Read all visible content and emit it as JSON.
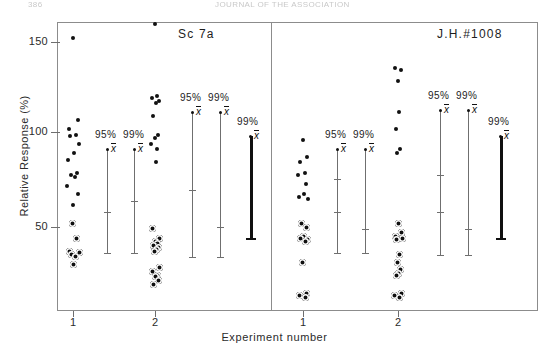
{
  "page": {
    "folio": "386",
    "running_head": "JOURNAL OF THE ASSOCIATION"
  },
  "chart_data": {
    "type": "scatter",
    "title": "",
    "xlabel": "Experiment number",
    "ylabel": "Relative Response  (%)",
    "ylim": [
      12,
      170
    ],
    "yticks": [
      50,
      100,
      150
    ],
    "ytick_labels": [
      "50",
      "100",
      "150"
    ],
    "grid": false,
    "legend": "none",
    "panels": [
      {
        "name": "left-panel",
        "label": "Sc  7a",
        "groups": [
          {
            "name": "experiment-1",
            "xtick_label": "1",
            "values": [
              152,
              108,
              103,
              100,
              99,
              95,
              90,
              86,
              79,
              78,
              77,
              72,
              68,
              62,
              52,
              44,
              37,
              36,
              35,
              34,
              30
            ],
            "intervals": [
              {
                "level": "95%",
                "mean": 92,
                "low": 36,
                "high": 92
              },
              {
                "level": "99%",
                "mean": 92,
                "low": 36,
                "high": 92
              }
            ]
          },
          {
            "name": "experiment-2",
            "xtick_label": "2",
            "values": [
              160,
              121,
              120,
              118,
              117,
              110,
              100,
              98,
              95,
              92,
              85,
              49,
              44,
              42,
              41,
              40,
              39,
              38,
              37,
              28,
              26,
              24,
              23,
              21,
              19
            ],
            "intervals": [
              {
                "level": "95%",
                "mean": 112,
                "low": 34,
                "high": 112
              },
              {
                "level": "99%",
                "mean": 112,
                "low": 34,
                "high": 112
              },
              {
                "level": "99%",
                "mean": 99,
                "low": 44,
                "high": 99
              }
            ]
          }
        ]
      },
      {
        "name": "right-panel",
        "label": "J.H.#1008",
        "groups": [
          {
            "name": "experiment-1",
            "xtick_label": "1",
            "values": [
              97,
              88,
              85,
              79,
              78,
              73,
              68,
              66,
              65,
              52,
              50,
              45,
              44,
              43,
              42,
              31,
              14,
              13,
              12
            ],
            "intervals": [
              {
                "level": "95%",
                "mean": 92,
                "low": 36,
                "high": 92
              },
              {
                "level": "99%",
                "mean": 92,
                "low": 36,
                "high": 92
              }
            ]
          },
          {
            "name": "experiment-2",
            "xtick_label": "2",
            "values": [
              136,
              135,
              129,
              112,
              103,
              92,
              90,
              52,
              47,
              45,
              44,
              43,
              35,
              31,
              27,
              25,
              24,
              14,
              13,
              12
            ],
            "intervals": [
              {
                "level": "95%",
                "mean": 113,
                "low": 35,
                "high": 113
              },
              {
                "level": "99%",
                "mean": 113,
                "low": 35,
                "high": 113
              },
              {
                "level": "99%",
                "mean": 99,
                "low": 44,
                "high": 99
              }
            ]
          }
        ]
      }
    ],
    "interval_labels": {
      "ci95": "95%",
      "ci99": "99%"
    },
    "mean_symbol": "x"
  }
}
